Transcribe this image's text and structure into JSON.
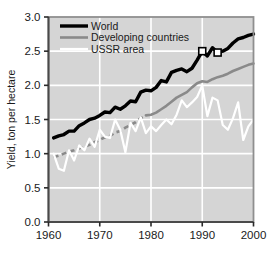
{
  "chart_data": {
    "type": "line",
    "title": "",
    "xlabel": "",
    "ylabel": "Yield, ton per hectare",
    "xlim": [
      1960,
      2000
    ],
    "ylim": [
      0.0,
      3.0
    ],
    "xticks": [
      "1960",
      "1970",
      "1980",
      "1990",
      "2000"
    ],
    "xtick_values": [
      1960,
      1970,
      1980,
      1990,
      2000
    ],
    "yticks": [
      "0.0",
      "0.5",
      "1.0",
      "1.5",
      "2.0",
      "2.5",
      "3.0"
    ],
    "ytick_values": [
      0.0,
      0.5,
      1.0,
      1.5,
      2.0,
      2.5,
      3.0
    ],
    "grid": true,
    "grid_color": "#ffffff",
    "plot_background": "#d5d5d5",
    "legend_position": "top-left",
    "legend": [
      {
        "label": "World",
        "color": "#000000",
        "width": 3.4,
        "style": "solid"
      },
      {
        "label": "Developing countries",
        "color": "#8a8a8a",
        "width": 2.6,
        "style": "solid"
      },
      {
        "label": "USSR area",
        "color": "#ffffff",
        "width": 2.2,
        "style": "solid"
      }
    ],
    "markers": [
      {
        "series": "World",
        "x": 1990,
        "y": 2.5,
        "shape": "open-square"
      },
      {
        "series": "World",
        "x": 1993,
        "y": 2.48,
        "shape": "open-square"
      }
    ],
    "series": [
      {
        "name": "World",
        "color": "#000000",
        "width": 3.4,
        "style": "solid",
        "x": [
          1961,
          1962,
          1963,
          1964,
          1965,
          1966,
          1967,
          1968,
          1969,
          1970,
          1971,
          1972,
          1973,
          1974,
          1975,
          1976,
          1977,
          1978,
          1979,
          1980,
          1981,
          1982,
          1983,
          1984,
          1985,
          1986,
          1987,
          1988,
          1989,
          1990,
          1991,
          1992,
          1993,
          1994,
          1995,
          1996,
          1997,
          1998,
          1999,
          2000
        ],
        "y": [
          1.23,
          1.26,
          1.28,
          1.33,
          1.33,
          1.41,
          1.45,
          1.5,
          1.52,
          1.56,
          1.61,
          1.6,
          1.68,
          1.65,
          1.7,
          1.77,
          1.76,
          1.9,
          1.93,
          1.92,
          1.97,
          2.07,
          2.05,
          2.19,
          2.22,
          2.24,
          2.2,
          2.25,
          2.37,
          2.5,
          2.43,
          2.55,
          2.48,
          2.5,
          2.54,
          2.62,
          2.68,
          2.7,
          2.73,
          2.75
        ]
      },
      {
        "name": "Developing countries",
        "color": "#8a8a8a",
        "width": 2.6,
        "style": "dashed-then-solid",
        "dash_until_x": 1979,
        "x": [
          1961,
          1962,
          1963,
          1964,
          1965,
          1966,
          1967,
          1968,
          1969,
          1970,
          1971,
          1972,
          1973,
          1974,
          1975,
          1976,
          1977,
          1978,
          1979,
          1980,
          1981,
          1982,
          1983,
          1984,
          1985,
          1986,
          1987,
          1988,
          1989,
          1990,
          1991,
          1992,
          1993,
          1994,
          1995,
          1996,
          1997,
          1998,
          1999,
          2000
        ],
        "y": [
          0.95,
          0.97,
          1.0,
          1.03,
          1.05,
          1.08,
          1.1,
          1.13,
          1.17,
          1.2,
          1.24,
          1.26,
          1.31,
          1.33,
          1.38,
          1.42,
          1.46,
          1.52,
          1.56,
          1.57,
          1.6,
          1.65,
          1.7,
          1.76,
          1.82,
          1.86,
          1.9,
          1.97,
          2.03,
          2.06,
          2.05,
          2.09,
          2.12,
          2.14,
          2.17,
          2.21,
          2.24,
          2.27,
          2.3,
          2.32
        ]
      },
      {
        "name": "USSR area",
        "color": "#ffffff",
        "width": 2.2,
        "style": "solid",
        "x": [
          1961,
          1962,
          1963,
          1964,
          1965,
          1966,
          1967,
          1968,
          1969,
          1970,
          1971,
          1972,
          1973,
          1974,
          1975,
          1976,
          1977,
          1978,
          1979,
          1980,
          1981,
          1982,
          1983,
          1984,
          1985,
          1986,
          1987,
          1988,
          1989,
          1990,
          1991,
          1992,
          1993,
          1994,
          1995,
          1996,
          1997,
          1998,
          1999,
          2000
        ],
        "y": [
          1.0,
          0.78,
          0.75,
          1.05,
          0.9,
          1.12,
          1.05,
          1.22,
          1.1,
          1.35,
          1.25,
          1.23,
          1.5,
          1.35,
          1.02,
          1.45,
          1.33,
          1.53,
          1.3,
          1.4,
          1.33,
          1.42,
          1.5,
          1.43,
          1.57,
          1.78,
          1.68,
          1.75,
          1.83,
          2.0,
          1.55,
          1.82,
          1.78,
          1.42,
          1.35,
          1.52,
          1.75,
          1.2,
          1.4,
          1.5
        ]
      }
    ]
  }
}
